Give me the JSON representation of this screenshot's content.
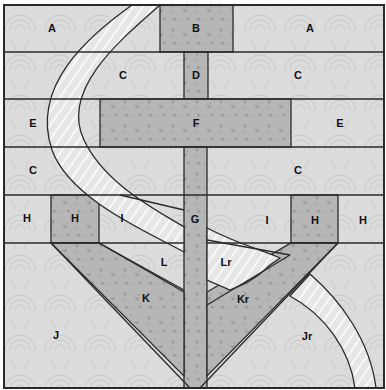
{
  "diagram": {
    "colors": {
      "background_fabric": "#dcdcdc",
      "dark_fabric": "#b4b4b4",
      "stripe_fabric": "#ececec",
      "outline": "#2a2a2a"
    },
    "labels": [
      {
        "id": "A-left",
        "text": "A",
        "x": 52,
        "y": 29
      },
      {
        "id": "B",
        "text": "B",
        "x": 196,
        "y": 29
      },
      {
        "id": "A-right",
        "text": "A",
        "x": 310,
        "y": 29
      },
      {
        "id": "C-top-left",
        "text": "C",
        "x": 123,
        "y": 76
      },
      {
        "id": "D",
        "text": "D",
        "x": 196,
        "y": 76
      },
      {
        "id": "C-top-right",
        "text": "C",
        "x": 298,
        "y": 76
      },
      {
        "id": "E-left",
        "text": "E",
        "x": 33,
        "y": 124
      },
      {
        "id": "F",
        "text": "F",
        "x": 196,
        "y": 124
      },
      {
        "id": "E-right",
        "text": "E",
        "x": 340,
        "y": 124
      },
      {
        "id": "C-mid-left",
        "text": "C",
        "x": 33,
        "y": 171
      },
      {
        "id": "C-mid-right",
        "text": "C",
        "x": 298,
        "y": 171
      },
      {
        "id": "H-far-left",
        "text": "H",
        "x": 27,
        "y": 219
      },
      {
        "id": "H-left",
        "text": "H",
        "x": 75,
        "y": 219
      },
      {
        "id": "I-left",
        "text": "I",
        "x": 122,
        "y": 219
      },
      {
        "id": "G",
        "text": "G",
        "x": 195,
        "y": 220
      },
      {
        "id": "I-right",
        "text": "I",
        "x": 267,
        "y": 221
      },
      {
        "id": "H-right",
        "text": "H",
        "x": 315,
        "y": 221
      },
      {
        "id": "H-far-right",
        "text": "H",
        "x": 363,
        "y": 221
      },
      {
        "id": "L",
        "text": "L",
        "x": 164,
        "y": 263
      },
      {
        "id": "Lr",
        "text": "Lr",
        "x": 226,
        "y": 263
      },
      {
        "id": "K",
        "text": "K",
        "x": 146,
        "y": 299
      },
      {
        "id": "Kr",
        "text": "Kr",
        "x": 243,
        "y": 300
      },
      {
        "id": "J",
        "text": "J",
        "x": 56,
        "y": 336
      },
      {
        "id": "Jr",
        "text": "Jr",
        "x": 307,
        "y": 337
      }
    ]
  }
}
